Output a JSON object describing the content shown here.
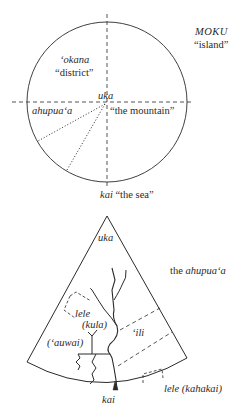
{
  "circle_diagram": {
    "title_term": "MOKU",
    "title_gloss": "“island”",
    "okana_term": "ʻokana",
    "okana_gloss": "“district”",
    "uka_term": "uka",
    "ahupuaa_term": "ahupuaʻa",
    "mountain_gloss": "“the mountain”",
    "kai_term": "kai",
    "sea_gloss": "“the sea”"
  },
  "sector_diagram": {
    "caption_prefix": "the",
    "caption_term": "ahupuaʻa",
    "uka_term": "uka",
    "lele_term": "lele",
    "kula_term": "(kula)",
    "auwai_term": "(ʻauwai)",
    "ili_term": "ʻili",
    "lele_kahakai_term": "lele (kahakai)",
    "kai_term": "kai"
  },
  "colors": {
    "ink": "#2a2a2a",
    "background": "#ffffff"
  }
}
